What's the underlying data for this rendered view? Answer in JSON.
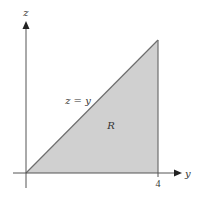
{
  "diagram": {
    "axes": {
      "vertical_label": "z",
      "horizontal_label": "y",
      "tick_labels": [
        "4"
      ]
    },
    "region": {
      "label": "R",
      "fill_color": "#d0d0d0",
      "edge_color": "#6e6e6e"
    },
    "line_label": "z = y",
    "axis_color": "#555555"
  }
}
